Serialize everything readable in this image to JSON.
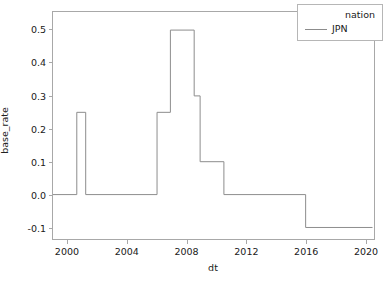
{
  "chart_data": {
    "type": "line",
    "title": "",
    "xlabel": "dt",
    "ylabel": "base_rate",
    "xlim": [
      1999.0,
      2020.6
    ],
    "ylim": [
      -0.135,
      0.555
    ],
    "grid": false,
    "legend": {
      "position": "upper right",
      "title": "nation",
      "entries": [
        {
          "name": "JPN",
          "color": "#8c8c8c"
        }
      ]
    },
    "xticks": [
      2000,
      2004,
      2008,
      2012,
      2016,
      2020
    ],
    "xtick_labels": [
      "2000",
      "2004",
      "2008",
      "2012",
      "2016",
      "2020"
    ],
    "yticks": [
      -0.1,
      0.0,
      0.1,
      0.2,
      0.3,
      0.4,
      0.5
    ],
    "ytick_labels": [
      "-0.1",
      "0.0",
      "0.1",
      "0.2",
      "0.3",
      "0.4",
      "0.5"
    ],
    "drawstyle": "steps-post",
    "series": [
      {
        "name": "JPN",
        "color": "#8c8c8c",
        "linewidth": 1,
        "x": [
          1999.0,
          2000.6,
          2001.2,
          2006.0,
          2006.9,
          2008.5,
          2008.9,
          2010.5,
          2016.0,
          2020.5
        ],
        "y": [
          0.0,
          0.25,
          0.0,
          0.25,
          0.5,
          0.3,
          0.1,
          0.0,
          -0.1,
          -0.1
        ]
      }
    ],
    "segments": [
      {
        "from_x": 1999.0,
        "to_x": 2000.6,
        "value": 0.0
      },
      {
        "from_x": 2000.6,
        "to_x": 2001.2,
        "value": 0.25
      },
      {
        "from_x": 2001.2,
        "to_x": 2006.0,
        "value": 0.0
      },
      {
        "from_x": 2006.0,
        "to_x": 2006.9,
        "value": 0.25
      },
      {
        "from_x": 2006.9,
        "to_x": 2008.5,
        "value": 0.5
      },
      {
        "from_x": 2008.5,
        "to_x": 2008.9,
        "value": 0.3
      },
      {
        "from_x": 2008.9,
        "to_x": 2010.5,
        "value": 0.1
      },
      {
        "from_x": 2010.5,
        "to_x": 2016.0,
        "value": 0.0
      },
      {
        "from_x": 2016.0,
        "to_x": 2020.5,
        "value": -0.1
      }
    ]
  }
}
